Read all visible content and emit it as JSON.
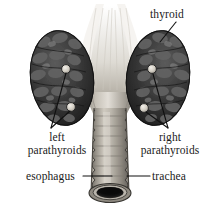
{
  "figure": {
    "background_color": "#ffffff",
    "width": 220,
    "height": 217
  },
  "labels": {
    "thyroid": "thyroid",
    "left_parathyroids_line1": "left",
    "left_parathyroids_line2": "parathyroids",
    "right_parathyroids_line1": "right",
    "right_parathyroids_line2": "parathyroids",
    "esophagus": "esophagus",
    "trachea": "trachea"
  },
  "colors": {
    "label_text": "#1a1a1a",
    "leader_line": "#101010",
    "lobe_dark": "#2b2b2b",
    "lobe_mid": "#4a4a4a",
    "lobe_light": "#6e6e6e",
    "parathyroid_nodule": "#d9d4cb",
    "trachea_body": "#a9a49a",
    "trachea_highlight": "#cfcac0",
    "trachea_shadow": "#6d6a63",
    "cartilage_ring": "#8b877e",
    "lumen_dark": "#151515",
    "membrane_light": "#ece9e3"
  },
  "structures": [
    {
      "name": "thyroid-left-lobe",
      "description": "dark lumpy lobe left of trachea"
    },
    {
      "name": "thyroid-right-lobe",
      "description": "dark lumpy lobe right of trachea"
    },
    {
      "name": "thyroid-isthmus-membrane",
      "description": "pale fan shaped membrane spreading upward between lobes"
    },
    {
      "name": "trachea-tube",
      "description": "central vertical cylindrical airway with cartilage rings"
    },
    {
      "name": "trachea-lumen",
      "description": "dark elliptical opening at the cut bottom end"
    },
    {
      "name": "esophagus",
      "description": "tube behind the trachea"
    },
    {
      "name": "parathyroid-gland",
      "count": 4,
      "description": "small pale round nodules embedded on lobes, two per side"
    }
  ]
}
